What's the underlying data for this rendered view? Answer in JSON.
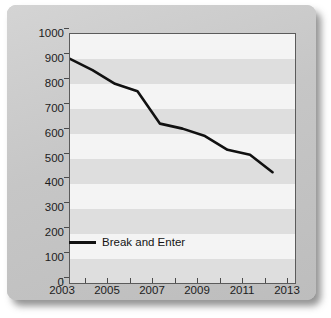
{
  "chart_data": {
    "type": "line",
    "title": "",
    "subtitle": "",
    "xlabel": "",
    "ylabel": "",
    "xlim": [
      2003,
      2013
    ],
    "ylim": [
      0,
      1000
    ],
    "ytick_step": 100,
    "xtick_step": 1,
    "xtick_label_step": 2,
    "grid": "horizontal-bands",
    "legend_position": "inside-bottom-left",
    "x": [
      2003,
      2004,
      2005,
      2006,
      2007,
      2008,
      2009,
      2010,
      2011,
      2012
    ],
    "y_ticks": [
      0,
      100,
      200,
      300,
      400,
      500,
      600,
      700,
      800,
      900,
      1000
    ],
    "y_tick_labels": [
      "0",
      "100",
      "200",
      "300",
      "400",
      "500",
      "600",
      "700",
      "800",
      "900",
      "1000"
    ],
    "x_ticks": [
      2003,
      2004,
      2005,
      2006,
      2007,
      2008,
      2009,
      2010,
      2011,
      2012,
      2013
    ],
    "x_tick_labels": [
      "2003",
      "",
      "2005",
      "",
      "2007",
      "",
      "2009",
      "",
      "2011",
      "",
      "2013"
    ],
    "series": [
      {
        "name": "Break and Enter",
        "color": "#111111",
        "line_width": 2.6,
        "values": [
          900,
          855,
          800,
          770,
          640,
          620,
          590,
          535,
          515,
          445
        ]
      }
    ],
    "legend": [
      {
        "label": "Break and Enter",
        "color": "#111111"
      }
    ],
    "colors": {
      "band_light": "#f4f4f4",
      "band_dark": "#dedede",
      "axis": "#5b5b5b",
      "text": "#1c1c1c",
      "card": "#c9c9c9",
      "series": "#111111"
    }
  }
}
